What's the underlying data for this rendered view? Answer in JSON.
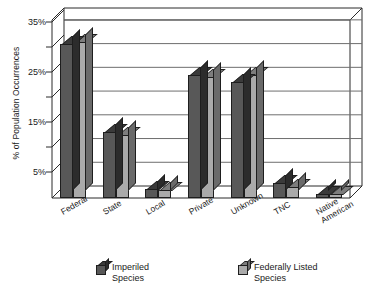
{
  "chart_data": {
    "type": "bar",
    "title": "",
    "xlabel": "",
    "ylabel": "% of Population Occurrences",
    "ylim": [
      0,
      37.5
    ],
    "ytick_labels": [
      "5%",
      "15%",
      "25%",
      "35%"
    ],
    "ytick_values": [
      5,
      15,
      25,
      35
    ],
    "gridlines": [
      5,
      10,
      15,
      20,
      25,
      30,
      35
    ],
    "grid": true,
    "legend_position": "bottom",
    "categories": [
      "Federal",
      "State",
      "Local",
      "Private",
      "Unknown",
      "TNC",
      "Native\nAmerican"
    ],
    "series": [
      {
        "name": "Imperiled\nSpecies",
        "color": "#585858",
        "values": [
          32.5,
          14.0,
          1.8,
          26.0,
          24.5,
          3.2,
          0.8
        ]
      },
      {
        "name": "Federally Listed\nSpecies",
        "color": "#aaaaaa",
        "values": [
          32.8,
          13.3,
          1.6,
          25.5,
          26.0,
          2.3,
          0.8
        ]
      }
    ]
  },
  "axis": {
    "y_title": "% of Population Occurrences"
  },
  "legend": {
    "items": [
      {
        "label": "Imperiled\nSpecies"
      },
      {
        "label": "Federally Listed\nSpecies"
      }
    ]
  },
  "caption": {
    "partial_text": ""
  },
  "colors": {
    "series_dark": "#585858",
    "series_light": "#aaaaaa",
    "axis": "#2b2b2b",
    "grid": "#6e6e6e",
    "plot_bg": "#ffffff"
  }
}
